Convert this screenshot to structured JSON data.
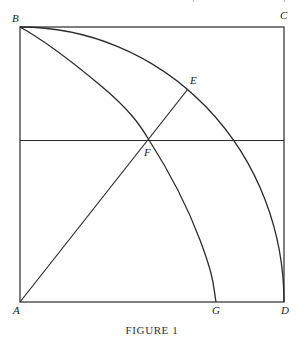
{
  "figure": {
    "caption": "FIGURE 1",
    "points": {
      "A": {
        "label": "A",
        "x": 20,
        "y": 302
      },
      "B": {
        "label": "B",
        "x": 20,
        "y": 27
      },
      "C": {
        "label": "C",
        "x": 284,
        "y": 27
      },
      "D": {
        "label": "D",
        "x": 284,
        "y": 302
      },
      "E": {
        "label": "E",
        "x": 188,
        "y": 89
      },
      "F": {
        "label": "F",
        "x": 149,
        "y": 140
      },
      "G": {
        "label": "G",
        "x": 216,
        "y": 302
      }
    },
    "elements": [
      {
        "type": "square",
        "vertices": [
          "A",
          "B",
          "C",
          "D"
        ]
      },
      {
        "type": "arc",
        "name": "quarter-circle",
        "from": "B",
        "through": "E",
        "to": "D",
        "center": "A"
      },
      {
        "type": "curve",
        "name": "quadratrix",
        "from": "B",
        "through": "F",
        "to": "G"
      },
      {
        "type": "segment",
        "from": "A",
        "to": "E",
        "through": "F"
      },
      {
        "type": "horizontal-line",
        "through": "F"
      }
    ]
  }
}
